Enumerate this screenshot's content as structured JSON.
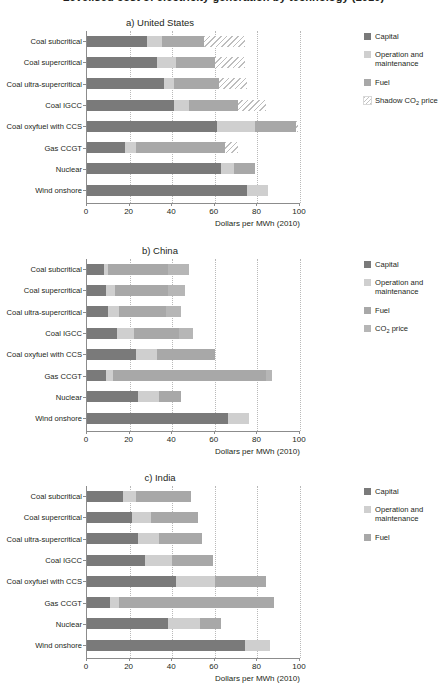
{
  "figure": {
    "suptitle": "Levelised cost of electricity generation by technology (2010)",
    "xaxis_title": "Dollars per MWh (2010)",
    "xticks": [
      "0",
      "20",
      "40",
      "60",
      "80",
      "100"
    ],
    "categories": [
      "Coal subcritical",
      "Coal supercritical",
      "Coal ultra-supercritical",
      "Coal IGCC",
      "Coal oxyfuel with CCS",
      "Gas CCGT",
      "Nuclear",
      "Wind onshore"
    ],
    "legend_labels": {
      "capital": "Capital",
      "om": "Operation and maintenance",
      "fuel": "Fuel",
      "co2": "CO2 price",
      "shadow": "Shadow CO2 price"
    },
    "colors": {
      "capital": "#7a7a7a",
      "om": "#cfcfcf",
      "fuel": "#a8a8a8",
      "co2": "#b6b6b6",
      "shadow": "#bdbdbd",
      "axis": "#8c8c8c",
      "grid": "#b9b9b9",
      "text": "#231f20"
    }
  },
  "chart_data": [
    {
      "type": "bar",
      "orientation": "horizontal",
      "stacked": true,
      "title": "a) United States",
      "panel": "a",
      "xlabel": "Dollars per MWh (2010)",
      "ylabel": "",
      "xlim": [
        0,
        100
      ],
      "xticks": [
        0,
        20,
        40,
        60,
        80,
        100
      ],
      "grid": "x-dotted",
      "legend_position": "right",
      "categories": [
        "Coal subcritical",
        "Coal supercritical",
        "Coal ultra-supercritical",
        "Coal IGCC",
        "Coal oxyfuel with CCS",
        "Gas CCGT",
        "Nuclear",
        "Wind onshore"
      ],
      "series": [
        {
          "name": "Capital",
          "key": "capital",
          "values": [
            28,
            33,
            36,
            41,
            61,
            18,
            63,
            75
          ]
        },
        {
          "name": "Operation and maintenance",
          "key": "om",
          "values": [
            7,
            9,
            5,
            7,
            18,
            5,
            6,
            10
          ]
        },
        {
          "name": "Fuel",
          "key": "fuel",
          "values": [
            20,
            18,
            21,
            23,
            19,
            42,
            10,
            0
          ]
        },
        {
          "name": "Shadow CO2 price",
          "key": "shadow",
          "values": [
            19,
            14,
            13,
            13,
            1,
            6,
            0,
            0
          ]
        }
      ],
      "totals": [
        74,
        74,
        75,
        84,
        99,
        71,
        79,
        85
      ]
    },
    {
      "type": "bar",
      "orientation": "horizontal",
      "stacked": true,
      "title": "b) China",
      "panel": "b",
      "xlabel": "Dollars per MWh (2010)",
      "ylabel": "",
      "xlim": [
        0,
        100
      ],
      "xticks": [
        0,
        20,
        40,
        60,
        80,
        100
      ],
      "grid": "x-dotted",
      "legend_position": "right",
      "categories": [
        "Coal subcritical",
        "Coal supercritical",
        "Coal ultra-supercritical",
        "Coal IGCC",
        "Coal oxyfuel with CCS",
        "Gas CCGT",
        "Nuclear",
        "Wind onshore"
      ],
      "series": [
        {
          "name": "Capital",
          "key": "capital",
          "values": [
            8,
            9,
            10,
            14,
            23,
            9,
            24,
            66
          ]
        },
        {
          "name": "Operation and maintenance",
          "key": "om",
          "values": [
            2,
            4,
            5,
            8,
            10,
            3,
            10,
            10
          ]
        },
        {
          "name": "Fuel",
          "key": "fuel",
          "values": [
            28,
            25,
            22,
            21,
            27,
            72,
            10,
            0
          ]
        },
        {
          "name": "CO2 price",
          "key": "co2",
          "values": [
            10,
            8,
            7,
            7,
            0,
            3,
            0,
            0
          ]
        }
      ],
      "totals": [
        48,
        46,
        44,
        50,
        60,
        87,
        44,
        76
      ]
    },
    {
      "type": "bar",
      "orientation": "horizontal",
      "stacked": true,
      "title": "c) India",
      "panel": "c",
      "xlabel": "Dollars per MWh (2010)",
      "ylabel": "",
      "xlim": [
        0,
        100
      ],
      "xticks": [
        0,
        20,
        40,
        60,
        80,
        100
      ],
      "grid": "x-dotted",
      "legend_position": "right",
      "categories": [
        "Coal subcritical",
        "Coal supercritical",
        "Coal ultra-supercritical",
        "Coal IGCC",
        "Coal oxyfuel with CCS",
        "Gas CCGT",
        "Nuclear",
        "Wind onshore"
      ],
      "series": [
        {
          "name": "Capital",
          "key": "capital",
          "values": [
            17,
            21,
            24,
            27,
            42,
            11,
            38,
            74
          ]
        },
        {
          "name": "Operation and maintenance",
          "key": "om",
          "values": [
            6,
            9,
            10,
            13,
            18,
            4,
            15,
            12
          ]
        },
        {
          "name": "Fuel",
          "key": "fuel",
          "values": [
            26,
            22,
            20,
            19,
            24,
            73,
            10,
            0
          ]
        }
      ],
      "totals": [
        49,
        52,
        54,
        59,
        84,
        88,
        63,
        86
      ]
    }
  ]
}
